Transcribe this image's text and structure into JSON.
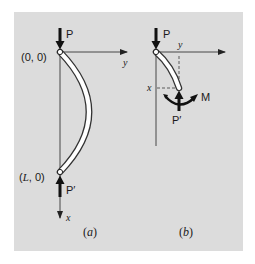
{
  "figure": {
    "background_color": "#dcdcdc",
    "line_color": "#222222",
    "beam_fill": "#ffffff",
    "panel_a": {
      "caption_open": "(",
      "caption_letter": "a",
      "caption_close": ")",
      "top_point_label": "(0, 0)",
      "bottom_point_label_open": "(",
      "bottom_point_label_var": "L",
      "bottom_point_label_rest": ", 0)",
      "top_force_label": "P",
      "bottom_force_label": "P′",
      "horizontal_axis_label": "y",
      "vertical_axis_label": "x"
    },
    "panel_b": {
      "caption_open": "(",
      "caption_letter": "b",
      "caption_close": ")",
      "top_force_label": "P",
      "end_force_label": "P′",
      "moment_label": "M",
      "horizontal_axis_label": "y",
      "x_coordinate_label": "x"
    }
  }
}
